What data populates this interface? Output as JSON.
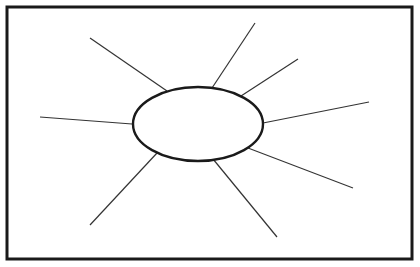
{
  "diagram": {
    "type": "spider-map",
    "background": "#ffffff",
    "stroke_color": "#1a1a1a",
    "frame": {
      "x": 7,
      "y": 7,
      "width": 405,
      "height": 252,
      "stroke_width": 3
    },
    "center_node": {
      "cx": 198,
      "cy": 124,
      "rx": 65,
      "ry": 37,
      "stroke_width": 2.4,
      "label": ""
    },
    "spokes": [
      {
        "name": "upper-left",
        "x1": 90,
        "y1": 38,
        "x2": 167,
        "y2": 91
      },
      {
        "name": "top",
        "x1": 255,
        "y1": 23,
        "x2": 212,
        "y2": 88
      },
      {
        "name": "upper-right",
        "x1": 298,
        "y1": 59,
        "x2": 241,
        "y2": 96
      },
      {
        "name": "right",
        "x1": 369,
        "y1": 102,
        "x2": 263,
        "y2": 123
      },
      {
        "name": "lower-right",
        "x1": 353,
        "y1": 188,
        "x2": 248,
        "y2": 148
      },
      {
        "name": "bottom",
        "x1": 277,
        "y1": 237,
        "x2": 213,
        "y2": 159
      },
      {
        "name": "lower-left",
        "x1": 90,
        "y1": 225,
        "x2": 157,
        "y2": 153
      },
      {
        "name": "left",
        "x1": 40,
        "y1": 117,
        "x2": 132,
        "y2": 124
      }
    ]
  }
}
